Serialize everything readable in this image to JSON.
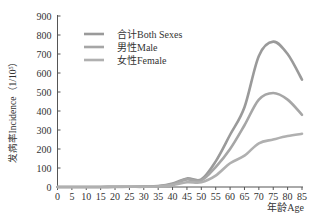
{
  "chart_data": {
    "type": "line",
    "title": "",
    "xlabel": "年龄Age",
    "ylabel": "发病率Incidence（1/10⁵）",
    "ylabel_parts": {
      "main": "发病率Incidence（1/10",
      "sup": "5",
      "end": "）"
    },
    "x": [
      0,
      5,
      10,
      15,
      20,
      25,
      30,
      35,
      40,
      45,
      50,
      55,
      60,
      65,
      70,
      75,
      80,
      85
    ],
    "x_ticks": [
      "0",
      "5",
      "10",
      "15",
      "20",
      "25",
      "30",
      "35",
      "40",
      "45",
      "50",
      "55",
      "60",
      "65",
      "70",
      "75",
      "80",
      "85"
    ],
    "y_ticks": [
      "0",
      "100",
      "200",
      "300",
      "400",
      "500",
      "600",
      "700",
      "800",
      "900"
    ],
    "xlim": [
      0,
      85
    ],
    "ylim": [
      0,
      900
    ],
    "grid": false,
    "legend_position": "upper-left",
    "series": [
      {
        "name": "合计Both Sexes",
        "color": "#9a9a9a",
        "values": [
          0,
          0,
          0,
          0,
          1,
          1,
          2,
          5,
          18,
          45,
          40,
          135,
          275,
          420,
          690,
          765,
          700,
          565
        ]
      },
      {
        "name": "男性Male",
        "color": "#a6a6a6",
        "values": [
          0,
          0,
          0,
          0,
          1,
          1,
          2,
          4,
          15,
          40,
          35,
          105,
          200,
          325,
          460,
          495,
          460,
          380
        ]
      },
      {
        "name": "女性Female",
        "color": "#b0b0b0",
        "values": [
          0,
          0,
          0,
          0,
          0,
          1,
          1,
          3,
          10,
          25,
          25,
          60,
          125,
          165,
          230,
          250,
          268,
          280
        ]
      }
    ]
  }
}
